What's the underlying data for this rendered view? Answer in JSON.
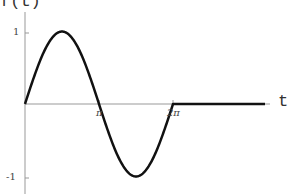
{
  "chart_data": {
    "type": "line",
    "title": "",
    "xlabel": "t",
    "ylabel": "f(t)",
    "x_ticks": [
      "π",
      "2π"
    ],
    "y_ticks": [
      "1",
      "-1"
    ],
    "xlim": [
      0,
      15.4
    ],
    "ylim": [
      -1.2,
      1.3
    ],
    "grid": false,
    "legend": null,
    "series": [
      {
        "name": "f(t)",
        "description": "sin(t) for 0 ≤ t ≤ 2π, 0 for t > 2π",
        "x": [
          0,
          0.785,
          1.571,
          2.356,
          3.142,
          3.927,
          4.712,
          5.498,
          6.283,
          8,
          10,
          12,
          15
        ],
        "y": [
          0,
          0.707,
          1,
          0.707,
          0,
          -0.707,
          -1,
          -0.707,
          0,
          0,
          0,
          0,
          0
        ]
      }
    ]
  },
  "labels": {
    "ylabel": "f(t)",
    "xlabel": "t",
    "ytick_pos": "1",
    "ytick_neg": "-1",
    "xtick_pi": "π",
    "xtick_2pi": "2π"
  }
}
